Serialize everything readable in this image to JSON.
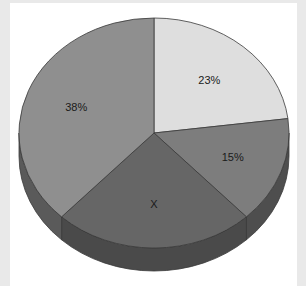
{
  "chart_data": {
    "type": "pie",
    "style": "3d",
    "title": "",
    "start_angle_deg": 0,
    "direction": "clockwise",
    "slices": [
      {
        "label": "23%",
        "value": 23,
        "color": "#dedede",
        "side_color": "#b5b5b5"
      },
      {
        "label": "15%",
        "value": 15,
        "color": "#7d7d7d",
        "side_color": "#4e4e4e"
      },
      {
        "label": "X",
        "value": 24,
        "color": "#666666",
        "side_color": "#4a4a4a"
      },
      {
        "label": "38%",
        "value": 38,
        "color": "#8f8f8f",
        "side_color": "#5a5a5a"
      }
    ],
    "unknown_slice": "X",
    "legend": null
  },
  "colors": {
    "background": "#ffffff",
    "frame": "#e9e9e9",
    "edge": "#3a3a3a"
  }
}
